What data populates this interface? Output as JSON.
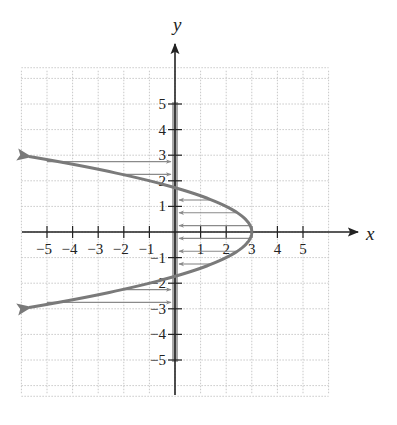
{
  "chart_data": {
    "type": "line",
    "title": "",
    "equation": "x = 3 - y^2",
    "xlabel": "x",
    "ylabel": "y",
    "xlim": [
      -6,
      6
    ],
    "ylim": [
      -6.3,
      6.3
    ],
    "grid": true,
    "x_ticks": [
      -5,
      -4,
      -3,
      -2,
      -1,
      1,
      2,
      3,
      4,
      5
    ],
    "y_ticks": [
      -5,
      -4,
      -3,
      -2,
      -1,
      1,
      2,
      3,
      4,
      5
    ],
    "x_tick_labels": [
      "−5",
      "−4",
      "−3",
      "−2",
      "−1",
      "1",
      "2",
      "3",
      "4",
      "5"
    ],
    "y_tick_labels": [
      "−5",
      "−4",
      "−3",
      "−2",
      "−1",
      "1",
      "2",
      "3",
      "4",
      "5"
    ],
    "series": [
      {
        "name": "parabola",
        "color": "#7a7a7a",
        "points": [
          [
            -5.7,
            2.95
          ],
          [
            -5,
            2.83
          ],
          [
            -4,
            2.65
          ],
          [
            -3,
            2.45
          ],
          [
            -2,
            2.24
          ],
          [
            -1,
            2.0
          ],
          [
            0,
            1.73
          ],
          [
            1,
            1.41
          ],
          [
            2,
            1.0
          ],
          [
            2.5,
            0.71
          ],
          [
            3,
            0
          ],
          [
            2.5,
            -0.71
          ],
          [
            2,
            -1.0
          ],
          [
            1,
            -1.41
          ],
          [
            0,
            -1.73
          ],
          [
            -1,
            -2.0
          ],
          [
            -2,
            -2.24
          ],
          [
            -3,
            -2.45
          ],
          [
            -4,
            -2.65
          ],
          [
            -5,
            -2.83
          ],
          [
            -5.7,
            -2.95
          ]
        ],
        "arrows_at_ends": true
      }
    ],
    "highlight_band": {
      "axis": "y",
      "x": 0,
      "from": -5,
      "to": 5,
      "color": "#9a9a9a"
    },
    "projection_arrows": [
      {
        "y": 2.75,
        "from_x": -5.0,
        "to_x": 0,
        "direction": "right"
      },
      {
        "y": 2.25,
        "from_x": -2.0,
        "to_x": 0,
        "direction": "right"
      },
      {
        "y": 1.25,
        "from_x": 1.4,
        "to_x": 0,
        "direction": "left"
      },
      {
        "y": 0.75,
        "from_x": 2.4,
        "to_x": 0,
        "direction": "left"
      },
      {
        "y": 0.25,
        "from_x": 2.95,
        "to_x": 0,
        "direction": "left"
      },
      {
        "y": -0.25,
        "from_x": 2.95,
        "to_x": 0,
        "direction": "left"
      },
      {
        "y": -0.75,
        "from_x": 2.4,
        "to_x": 0,
        "direction": "left"
      },
      {
        "y": -1.25,
        "from_x": 1.4,
        "to_x": 0,
        "direction": "left"
      },
      {
        "y": -2.25,
        "from_x": -2.0,
        "to_x": 0,
        "direction": "right"
      },
      {
        "y": -2.75,
        "from_x": -5.0,
        "to_x": 0,
        "direction": "right"
      }
    ]
  },
  "axes": {
    "x_label": "x",
    "y_label": "y"
  },
  "colors": {
    "curve": "#7a7a7a",
    "axis": "#222222",
    "grid": "#c8c8c8",
    "band": "#a8a8a8",
    "arrow": "#8a8a8a"
  }
}
